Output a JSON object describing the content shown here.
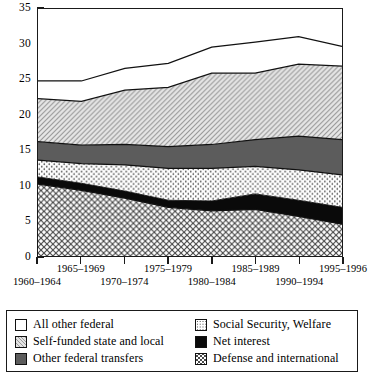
{
  "chart_data": {
    "type": "area",
    "stacked": true,
    "title": "",
    "xlabel": "",
    "ylabel": "",
    "ylim": [
      0,
      35
    ],
    "ytick_values": [
      0,
      5,
      10,
      15,
      20,
      25,
      30,
      35
    ],
    "ytick_labels": [
      "0",
      "5",
      "10",
      "15",
      "20",
      "25",
      "30",
      "35"
    ],
    "grid": false,
    "legend_position": "below",
    "categories": [
      "1960–1964",
      "1965–1969",
      "1970–1974",
      "1975–1979",
      "1980–1984",
      "1985–1989",
      "1990–1994",
      "1995–1996"
    ],
    "series": [
      {
        "name": "Defense and international",
        "pattern": "cross-hatch",
        "color": "#ffffff",
        "values": [
          10.2,
          9.3,
          8.2,
          6.9,
          6.4,
          6.6,
          5.6,
          4.5
        ]
      },
      {
        "name": "Net interest",
        "pattern": "solid-black",
        "color": "#0a0a0a",
        "values": [
          1.0,
          1.0,
          1.0,
          1.0,
          1.4,
          2.2,
          2.3,
          2.4
        ]
      },
      {
        "name": "Social Security, Welfare",
        "pattern": "fine-dots",
        "color": "#ffffff",
        "values": [
          2.4,
          2.8,
          3.7,
          4.5,
          4.6,
          3.9,
          4.3,
          4.6
        ]
      },
      {
        "name": "Other federal transfers",
        "pattern": "solid-gray",
        "color": "#5c5c5c",
        "values": [
          2.6,
          2.6,
          2.9,
          3.1,
          3.4,
          3.8,
          4.8,
          5.0
        ]
      },
      {
        "name": "Self-funded state and local",
        "pattern": "diagonal-hatch",
        "color": "#e3e3e3",
        "values": [
          6.1,
          6.2,
          7.7,
          8.4,
          10.1,
          9.4,
          10.2,
          10.4
        ]
      },
      {
        "name": "All other federal",
        "pattern": "white",
        "color": "#ffffff",
        "values": [
          2.5,
          2.9,
          3.1,
          3.4,
          3.7,
          4.4,
          3.9,
          2.8
        ]
      }
    ],
    "totals": [
      24.8,
      24.8,
      26.6,
      27.3,
      29.6,
      30.3,
      31.1,
      29.7
    ]
  },
  "legend": {
    "left_column": [
      {
        "label": "All other federal",
        "swatch": "sw-white"
      },
      {
        "label": "Self-funded state and local",
        "swatch": "sw-diag"
      },
      {
        "label": "Other federal transfers",
        "swatch": "sw-dark"
      }
    ],
    "right_column": [
      {
        "label": "Social Security, Welfare",
        "swatch": "sw-dots"
      },
      {
        "label": "Net interest",
        "swatch": "sw-black"
      },
      {
        "label": "Defense and international",
        "swatch": "sw-cross"
      }
    ]
  }
}
